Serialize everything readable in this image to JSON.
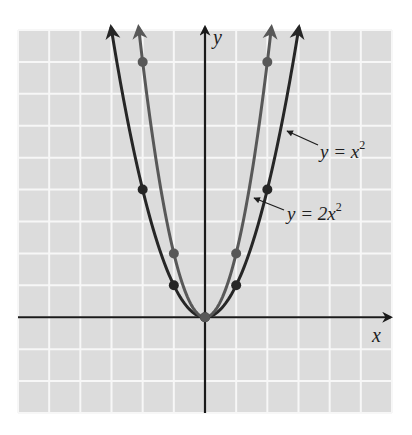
{
  "chart_data": {
    "type": "line",
    "title": "",
    "xlabel": "x",
    "ylabel": "y",
    "xlim": [
      -6,
      6
    ],
    "ylim": [
      -3,
      9
    ],
    "grid": true,
    "x_ticks": [
      -6,
      -5,
      -4,
      -3,
      -2,
      -1,
      0,
      1,
      2,
      3,
      4,
      5,
      6
    ],
    "y_ticks": [
      -3,
      -2,
      -1,
      0,
      1,
      2,
      3,
      4,
      5,
      6,
      7,
      8,
      9
    ],
    "tick_labels_shown": false,
    "series": [
      {
        "name": "y = x^2",
        "label": "y = x²",
        "color": "#262626",
        "function": "x^2",
        "marked_points": [
          [
            -2,
            4
          ],
          [
            -1,
            1
          ],
          [
            0,
            0
          ],
          [
            1,
            1
          ],
          [
            2,
            4
          ]
        ]
      },
      {
        "name": "y = 2x^2",
        "label": "y = 2x²",
        "color": "#585858",
        "function": "2x^2",
        "marked_points": [
          [
            -2,
            8
          ],
          [
            -1,
            2
          ],
          [
            0,
            0
          ],
          [
            1,
            2
          ],
          [
            2,
            8
          ]
        ]
      }
    ],
    "annotations": [
      {
        "text": "y = x²",
        "points_to": "y = x^2 curve, right branch",
        "position": "right"
      },
      {
        "text": "y = 2x²",
        "points_to": "y = 2x^2 curve, right branch",
        "position": "right"
      }
    ]
  },
  "labels": {
    "x_axis": "x",
    "y_axis": "y",
    "curve1_prefix": "y = x",
    "curve1_exp": "2",
    "curve2_prefix": "y = 2x",
    "curve2_exp": "2"
  },
  "colors": {
    "background": "#ffffff",
    "plot_area": "#dcdcdc",
    "grid": "#f7f7f7",
    "axis": "#1a1a1a"
  }
}
